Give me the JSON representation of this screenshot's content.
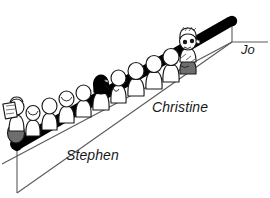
{
  "scene": {
    "title": "Queue of people on a sloped line",
    "background_color": "#ffffff",
    "ink_color": "#000000",
    "line_color": "#4a4a4a"
  },
  "labels": {
    "stephen": "Stephen",
    "christine": "Christine",
    "jo": "Jo"
  },
  "figures": {
    "count": 11,
    "highlighted": [
      {
        "name": "Stephen",
        "position": "back-of-queue",
        "detail": "holding-book"
      },
      {
        "name": "Christine",
        "position": "middle-of-queue",
        "detail": "dark-hair"
      },
      {
        "name": "Jo",
        "position": "front-of-queue",
        "detail": "detailed-shaded"
      }
    ]
  },
  "icons": {
    "queue_line": "sloped-bar-icon",
    "person": "person-figure-icon",
    "leader": "leader-line-icon"
  }
}
